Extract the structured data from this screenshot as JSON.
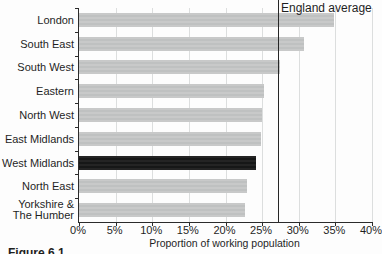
{
  "figure": {
    "caption_fragment": "Figure 6.1"
  },
  "chart_data": {
    "type": "bar",
    "orientation": "horizontal",
    "title": "",
    "xlabel": "Proportion of working population",
    "ylabel": "",
    "xlim": [
      0,
      40
    ],
    "grid": "vertical",
    "legend": "none",
    "categories": [
      "London",
      "South East",
      "South West",
      "Eastern",
      "North West",
      "East Midlands",
      "West Midlands",
      "North East",
      "Yorkshire & The Humber"
    ],
    "values": [
      34.8,
      30.7,
      27.5,
      25.2,
      25.0,
      24.8,
      24.1,
      22.9,
      22.7
    ],
    "highlight_category": "West Midlands",
    "reference_line": {
      "label": "England average",
      "value": 27.1
    },
    "x_ticks": [
      "0%",
      "5%",
      "10%",
      "15%",
      "20%",
      "25%",
      "30%",
      "35%",
      "40%"
    ],
    "colors": {
      "bar": "#c4c5c5",
      "highlight_bar": "#1d1d1d",
      "axis": "#2b2b2b",
      "gridline": "#dcdede",
      "reference_line": "#262626",
      "text": "#1f1f1f",
      "background": "#fdfdfd"
    }
  }
}
